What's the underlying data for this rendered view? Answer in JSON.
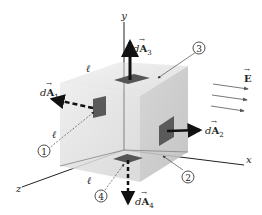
{
  "diagram": {
    "axes": {
      "x": "x",
      "y": "y",
      "z": "z"
    },
    "edge_label": "ℓ",
    "field": {
      "symbol": "E",
      "arrow_count": 3,
      "direction": "+x"
    },
    "faces": [
      {
        "id": "1",
        "label": "①",
        "vector": "dA",
        "subscript": "1",
        "direction": "-x"
      },
      {
        "id": "2",
        "label": "②",
        "vector": "dA",
        "subscript": "2",
        "direction": "+x"
      },
      {
        "id": "3",
        "label": "③",
        "vector": "dA",
        "subscript": "3",
        "direction": "+y"
      },
      {
        "id": "4",
        "label": "④",
        "vector": "dA",
        "subscript": "4",
        "direction": "-y"
      }
    ],
    "colors": {
      "cube_front": "#d9d9d9",
      "cube_top": "#e6e6e6",
      "cube_right": "#c9c9c9",
      "patch": "#5a5a5a",
      "arrow": "#111111",
      "field_lines": "#555555"
    }
  }
}
